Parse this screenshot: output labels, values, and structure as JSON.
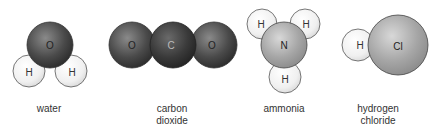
{
  "molecules": [
    {
      "name_line1": "water",
      "name_line2": "",
      "atoms": {
        "o": "O",
        "h1": "H",
        "h2": "H"
      }
    },
    {
      "name_line1": "carbon",
      "name_line2": "dioxide",
      "atoms": {
        "o1": "O",
        "c": "C",
        "o2": "O"
      }
    },
    {
      "name_line1": "ammonia",
      "name_line2": "",
      "atoms": {
        "h1": "H",
        "h2": "H",
        "n": "N",
        "h3": "H"
      }
    },
    {
      "name_line1": "hydrogen",
      "name_line2": "chloride",
      "atoms": {
        "h": "H",
        "cl": "Cl"
      }
    }
  ],
  "colors": {
    "oxygen": "#4a4a4a",
    "carbon": "#3a3a3a",
    "hydrogen": "#f2f2f2",
    "nitrogen": "#a8a8a8",
    "chlorine": "#9e9e9e"
  }
}
